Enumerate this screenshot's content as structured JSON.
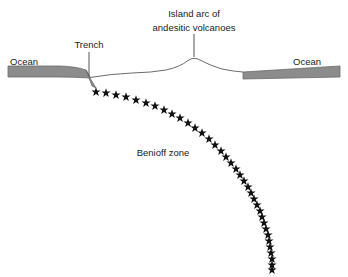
{
  "figure": {
    "type": "geology-cross-section",
    "title_text": "",
    "background_color": "#ffffff",
    "width": 348,
    "height": 277
  },
  "labels": {
    "ocean_left": "Ocean",
    "ocean_right": "Ocean",
    "trench": "Trench",
    "island_arc_line1": "Island arc of",
    "island_arc_line2": "andesitic volcanoes",
    "benioff_zone": "Benioff zone"
  },
  "colors": {
    "ocean_layer_fill": "#8c8c8c",
    "ocean_layer_stroke": "#6b6b6b",
    "crust_outline": "#6b6b6b",
    "star_fill": "#111111",
    "text": "#1a1a1a",
    "leader_line": "#555555",
    "background": "#ffffff"
  },
  "chart_data": {
    "type": "scatter",
    "xlabel": "",
    "ylabel": "",
    "series": [
      {
        "name": "Benioff zone earthquake foci",
        "marker": "star",
        "count": 42,
        "points": [
          [
            96,
            92
          ],
          [
            106,
            93
          ],
          [
            116,
            95
          ],
          [
            126,
            97
          ],
          [
            136,
            100
          ],
          [
            146,
            103
          ],
          [
            155,
            106
          ],
          [
            164,
            110
          ],
          [
            172,
            114
          ],
          [
            180,
            118
          ],
          [
            188,
            123
          ],
          [
            195,
            128
          ],
          [
            202,
            133
          ],
          [
            209,
            139
          ],
          [
            215,
            145
          ],
          [
            221,
            151
          ],
          [
            226,
            157
          ],
          [
            231,
            163
          ],
          [
            236,
            169
          ],
          [
            240,
            175
          ],
          [
            244,
            181
          ],
          [
            248,
            187
          ],
          [
            251,
            193
          ],
          [
            254,
            199
          ],
          [
            257,
            205
          ],
          [
            260,
            211
          ],
          [
            262,
            217
          ],
          [
            264,
            223
          ],
          [
            266,
            229
          ],
          [
            268,
            235
          ],
          [
            269,
            241
          ],
          [
            270,
            247
          ],
          [
            271,
            253
          ],
          [
            272,
            259
          ],
          [
            272,
            265
          ],
          [
            272,
            270
          ]
        ]
      }
    ],
    "annotations": [
      {
        "text": "Trench",
        "x": 89,
        "y": 46
      },
      {
        "text": "Island arc of andesitic volcanoes",
        "x": 194,
        "y": 18
      },
      {
        "text": "Benioff zone",
        "x": 163,
        "y": 152
      },
      {
        "text": "Ocean",
        "x": 31,
        "y": 62
      },
      {
        "text": "Ocean",
        "x": 315,
        "y": 62
      }
    ],
    "grid": false,
    "legend": "none"
  },
  "features": {
    "trench_position_x": 89,
    "island_arc_peak_x": 194,
    "ocean_layer_top_y": 66,
    "ocean_layer_bottom_y": 77
  }
}
